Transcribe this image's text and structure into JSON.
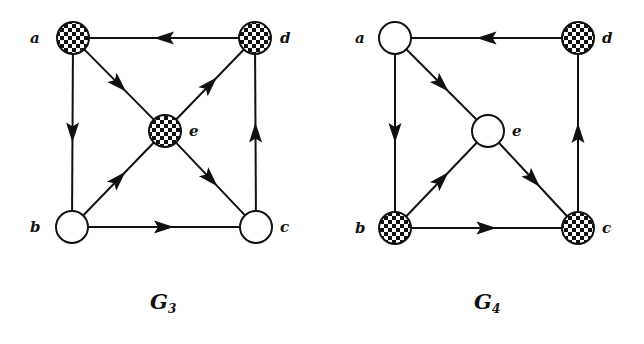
{
  "colors": {
    "ink": "#111111",
    "background": "#ffffff",
    "checker_dark": "#111111",
    "checker_light": "#ffffff"
  },
  "graphs": [
    {
      "id": "G3",
      "title": "G",
      "subscript": "3",
      "title_pos": [
        150,
        309
      ],
      "nodes": [
        {
          "id": "a",
          "label": "a",
          "x": 73,
          "y": 38,
          "fill": "checkered",
          "label_pos": [
            30,
            43
          ]
        },
        {
          "id": "d",
          "label": "d",
          "x": 255,
          "y": 38,
          "fill": "checkered",
          "label_pos": [
            280,
            43
          ]
        },
        {
          "id": "e",
          "label": "e",
          "x": 165,
          "y": 131,
          "fill": "checkered",
          "label_pos": [
            189,
            136
          ]
        },
        {
          "id": "b",
          "label": "b",
          "x": 72,
          "y": 227,
          "fill": "white",
          "label_pos": [
            30,
            232
          ]
        },
        {
          "id": "c",
          "label": "c",
          "x": 256,
          "y": 227,
          "fill": "white",
          "label_pos": [
            280,
            232
          ]
        }
      ],
      "edges": [
        {
          "from": "d",
          "to": "a"
        },
        {
          "from": "a",
          "to": "b"
        },
        {
          "from": "a",
          "to": "e"
        },
        {
          "from": "e",
          "to": "d"
        },
        {
          "from": "b",
          "to": "e"
        },
        {
          "from": "e",
          "to": "c"
        },
        {
          "from": "b",
          "to": "c"
        },
        {
          "from": "c",
          "to": "d"
        }
      ]
    },
    {
      "id": "G4",
      "title": "G",
      "subscript": "4",
      "title_pos": [
        474,
        309
      ],
      "nodes": [
        {
          "id": "a",
          "label": "a",
          "x": 395,
          "y": 38,
          "fill": "white",
          "label_pos": [
            355,
            43
          ]
        },
        {
          "id": "d",
          "label": "d",
          "x": 578,
          "y": 38,
          "fill": "checkered",
          "label_pos": [
            602,
            43
          ]
        },
        {
          "id": "e",
          "label": "e",
          "x": 488,
          "y": 131,
          "fill": "white",
          "label_pos": [
            512,
            136
          ]
        },
        {
          "id": "b",
          "label": "b",
          "x": 395,
          "y": 228,
          "fill": "checkered",
          "label_pos": [
            355,
            233
          ]
        },
        {
          "id": "c",
          "label": "c",
          "x": 578,
          "y": 228,
          "fill": "checkered",
          "label_pos": [
            602,
            233
          ]
        }
      ],
      "edges": [
        {
          "from": "d",
          "to": "a"
        },
        {
          "from": "a",
          "to": "b"
        },
        {
          "from": "a",
          "to": "e"
        },
        {
          "from": "b",
          "to": "e"
        },
        {
          "from": "e",
          "to": "c"
        },
        {
          "from": "b",
          "to": "c"
        },
        {
          "from": "c",
          "to": "d"
        }
      ]
    }
  ],
  "node_radius": 16
}
